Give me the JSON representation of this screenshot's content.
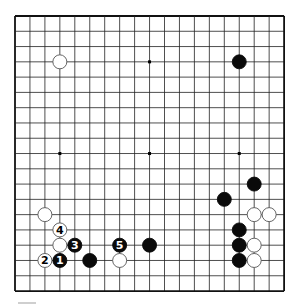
{
  "board": {
    "size": 19,
    "origin_x": 15,
    "origin_y": 16,
    "spacing_x": 14.95,
    "spacing_y": 15.28,
    "line_color": "#222222",
    "edge_color": "#111111",
    "stone_radius": 7,
    "star_points": [
      [
        3,
        3
      ],
      [
        9,
        3
      ],
      [
        15,
        3
      ],
      [
        3,
        9
      ],
      [
        9,
        9
      ],
      [
        15,
        9
      ],
      [
        3,
        15
      ],
      [
        9,
        15
      ],
      [
        15,
        15
      ]
    ]
  },
  "stones": [
    {
      "color": "white",
      "col": 3,
      "row": 3,
      "label": ""
    },
    {
      "color": "black",
      "col": 15,
      "row": 3,
      "label": ""
    },
    {
      "color": "black",
      "col": 16,
      "row": 11,
      "label": ""
    },
    {
      "color": "black",
      "col": 14,
      "row": 12,
      "label": ""
    },
    {
      "color": "white",
      "col": 2,
      "row": 13,
      "label": ""
    },
    {
      "color": "white",
      "col": 16,
      "row": 13,
      "label": ""
    },
    {
      "color": "white",
      "col": 17,
      "row": 13,
      "label": ""
    },
    {
      "color": "white",
      "col": 3,
      "row": 14,
      "label": "4"
    },
    {
      "color": "black",
      "col": 15,
      "row": 14,
      "label": ""
    },
    {
      "color": "white",
      "col": 3,
      "row": 15,
      "label": ""
    },
    {
      "color": "black",
      "col": 4,
      "row": 15,
      "label": "3"
    },
    {
      "color": "black",
      "col": 7,
      "row": 15,
      "label": "5"
    },
    {
      "color": "black",
      "col": 9,
      "row": 15,
      "label": ""
    },
    {
      "color": "black",
      "col": 15,
      "row": 15,
      "label": ""
    },
    {
      "color": "white",
      "col": 16,
      "row": 15,
      "label": ""
    },
    {
      "color": "white",
      "col": 2,
      "row": 16,
      "label": "2"
    },
    {
      "color": "black",
      "col": 3,
      "row": 16,
      "label": "1"
    },
    {
      "color": "black",
      "col": 5,
      "row": 16,
      "label": ""
    },
    {
      "color": "white",
      "col": 7,
      "row": 16,
      "label": ""
    },
    {
      "color": "black",
      "col": 15,
      "row": 16,
      "label": ""
    },
    {
      "color": "white",
      "col": 16,
      "row": 16,
      "label": ""
    }
  ]
}
